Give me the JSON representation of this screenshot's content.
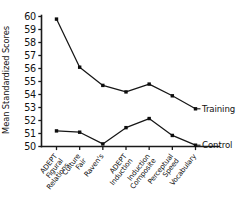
{
  "chart_data": {
    "type": "line",
    "title": "",
    "xlabel": "",
    "ylabel": "Mean Standardized Scores",
    "ylim": [
      50,
      60
    ],
    "yticks": [
      50,
      51,
      52,
      53,
      54,
      55,
      56,
      57,
      58,
      59,
      60
    ],
    "ytick_labels": [
      "50",
      "51",
      "52",
      "53",
      "54",
      "55",
      "56",
      "57",
      "58",
      "59",
      "60"
    ],
    "grid": false,
    "legend_position": "inline-right-end-of-line",
    "categories": [
      "ADEPT Figural Relations",
      "Culture Fair",
      "Raven's",
      "ADEPT Induction",
      "Induction Composite",
      "Perceptual Speed",
      "Vocabulary"
    ],
    "category_lines": [
      [
        "ADEPT",
        "Figural",
        "Relations"
      ],
      [
        "Culture",
        "Fair"
      ],
      [
        "Raven's"
      ],
      [
        "ADEPT",
        "Induction"
      ],
      [
        "Induction",
        "Composite"
      ],
      [
        "Perceptual",
        "Speed"
      ],
      [
        "Vocabulary"
      ]
    ],
    "series": [
      {
        "name": "Training",
        "label": "Training",
        "color": "#161616",
        "marker": "square",
        "values": [
          59.8,
          56.1,
          54.7,
          54.2,
          54.8,
          53.9,
          52.9
        ]
      },
      {
        "name": "Control",
        "label": "Control",
        "color": "#161616",
        "marker": "square",
        "values": [
          51.2,
          51.1,
          50.2,
          51.45,
          52.15,
          50.85,
          50.1
        ]
      }
    ]
  },
  "axis": {
    "y_title": "Mean Standardized Scores"
  }
}
